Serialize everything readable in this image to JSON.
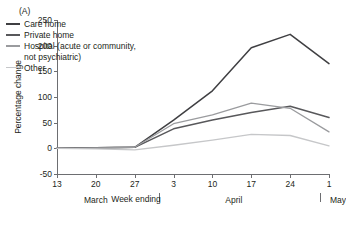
{
  "panel_label": "(A)",
  "chart_data": {
    "type": "line",
    "title": "",
    "xlabel": "Week ending",
    "ylabel": "Percentage change",
    "categories": [
      "13",
      "20",
      "27",
      "3",
      "10",
      "17",
      "24",
      "1"
    ],
    "x_tick_labels": [
      "13",
      "20",
      "27",
      "3",
      "10",
      "17",
      "24",
      "1"
    ],
    "month_labels": [
      "March",
      "April",
      "May"
    ],
    "ylim": [
      -50,
      250
    ],
    "y_ticks": [
      -50,
      0,
      50,
      100,
      150,
      200,
      250
    ],
    "y_tick_labels": [
      "-50",
      "0",
      "50",
      "100",
      "150",
      "200",
      "250"
    ],
    "grid": false,
    "legend_position": "upper-left-inside",
    "series": [
      {
        "name": "Care home",
        "color": "#3f3f42",
        "values": [
          0,
          1,
          2,
          55,
          112,
          196,
          222,
          165
        ]
      },
      {
        "name": "Private home",
        "color": "#58585b",
        "values": [
          0,
          1,
          2,
          38,
          55,
          70,
          82,
          60
        ]
      },
      {
        "name": "Hospital (acute or community, not psychiatric)",
        "color": "#9a9b9e",
        "values": [
          0,
          1,
          2,
          48,
          65,
          88,
          78,
          32
        ]
      },
      {
        "name": "Other",
        "color": "#c6c7c9",
        "values": [
          0,
          -1,
          -3,
          6,
          16,
          27,
          25,
          5
        ]
      }
    ]
  },
  "legend": {
    "entries": [
      {
        "label": "Care home"
      },
      {
        "label": "Private home"
      },
      {
        "label": "Hospital (acute or community,\nnot psychiatric)"
      },
      {
        "label": "Other"
      }
    ]
  }
}
